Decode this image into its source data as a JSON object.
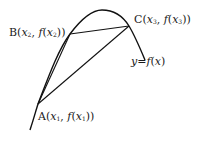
{
  "diagram": {
    "type": "secant-lines-on-concave-curve",
    "curve_label": {
      "y": "y",
      "eq": "=",
      "f": "f",
      "x": "x"
    },
    "points": [
      {
        "name": "A",
        "var": "x",
        "sub": "1"
      },
      {
        "name": "B",
        "var": "x",
        "sub": "2"
      },
      {
        "name": "C",
        "var": "x",
        "sub": "3"
      }
    ],
    "segments": [
      "AB",
      "BC",
      "AC"
    ],
    "colors": {
      "stroke": "#111111",
      "text": "#1a1a1a",
      "background": "#ffffff"
    }
  }
}
